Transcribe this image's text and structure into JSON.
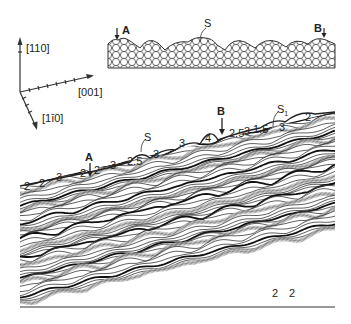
{
  "axes": {
    "vertical": "[110]",
    "horizontal": "[001]",
    "diagonal": "[1ī0]"
  },
  "inset": {
    "label_a": "A",
    "label_s": "S",
    "label_b": "B"
  },
  "surface": {
    "label_a": "A",
    "label_b": "B",
    "label_s": "S",
    "label_s1": "S",
    "label_s1_sub": "1",
    "step_labels": [
      {
        "text": "2",
        "x": 24,
        "y": 181
      },
      {
        "text": "2",
        "x": 39,
        "y": 178
      },
      {
        "text": "3",
        "x": 56,
        "y": 172
      },
      {
        "text": "2",
        "x": 80,
        "y": 168
      },
      {
        "text": "2",
        "x": 94,
        "y": 165
      },
      {
        "text": "3",
        "x": 110,
        "y": 160
      },
      {
        "text": "2.5",
        "x": 127,
        "y": 156
      },
      {
        "text": "3",
        "x": 153,
        "y": 149
      },
      {
        "text": "3",
        "x": 179,
        "y": 138
      },
      {
        "text": "4",
        "x": 205,
        "y": 133
      },
      {
        "text": "2.5",
        "x": 229,
        "y": 128
      },
      {
        "text": "3",
        "x": 244,
        "y": 126
      },
      {
        "text": "1.5",
        "x": 253,
        "y": 124
      },
      {
        "text": "3",
        "x": 279,
        "y": 122
      },
      {
        "text": "2",
        "x": 305,
        "y": 112
      }
    ],
    "bottom_labels": [
      {
        "text": "2",
        "x": 272,
        "y": 288
      },
      {
        "text": "2",
        "x": 289,
        "y": 288
      }
    ]
  }
}
